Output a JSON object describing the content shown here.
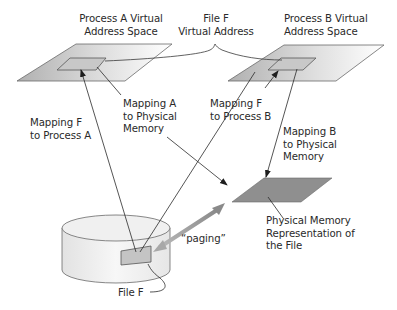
{
  "diagram": {
    "labels": {
      "process_a_space": "Process A Virtual\nAddress Space",
      "file_f_virtual": "File F\nVirtual Address",
      "process_b_space": "Process B Virtual\nAddress Space",
      "mapping_f_a": "Mapping F\nto Process A",
      "mapping_a_phys": "Mapping A\nto Physical\nMemory",
      "mapping_f_b": "Mapping F\nto Process B",
      "mapping_b_phys": "Mapping B\nto Physical\nMemory",
      "physical_repr": "Physical Memory\nRepresentation of\nthe File",
      "paging": "“paging”",
      "file_f": "File F"
    },
    "nodes": [
      {
        "id": "process_a_space",
        "shape": "parallelogram",
        "fill": "gradient-gray"
      },
      {
        "id": "process_a_file_region",
        "shape": "parallelogram",
        "fill": "#c8c8c8"
      },
      {
        "id": "process_b_space",
        "shape": "parallelogram",
        "fill": "gradient-gray"
      },
      {
        "id": "process_b_file_region",
        "shape": "parallelogram",
        "fill": "#c8c8c8"
      },
      {
        "id": "physical_memory",
        "shape": "parallelogram",
        "fill": "#8f8f8f"
      },
      {
        "id": "disk",
        "shape": "cylinder",
        "fill": "#eeeeee"
      },
      {
        "id": "file_f_on_disk",
        "shape": "curved-rect",
        "fill": "#c4c4c4"
      }
    ],
    "edges": [
      {
        "from": "file_f_on_disk",
        "to": "process_a_file_region",
        "label": "mapping_f_a",
        "arrow": "end"
      },
      {
        "from": "file_f_on_disk",
        "to": "process_b_file_region",
        "label": "mapping_f_b",
        "arrow": "end"
      },
      {
        "from": "mapping_a_phys",
        "to": "physical_memory",
        "arrow": "end"
      },
      {
        "from": "process_b_file_region",
        "to": "physical_memory",
        "label": "mapping_b_phys",
        "arrow": "end"
      },
      {
        "from": "file_f_on_disk",
        "to": "physical_memory",
        "label": "paging",
        "arrow": "both"
      }
    ],
    "colors": {
      "line": "#3a3a3a",
      "text": "#2a2a2a",
      "space_fill_dark": "#b4b4b4",
      "space_fill_light": "#ffffff",
      "region_fill": "#c8c8c8",
      "physical_fill": "#8f8f8f",
      "paging_arrow": "#9a9a9a"
    }
  }
}
